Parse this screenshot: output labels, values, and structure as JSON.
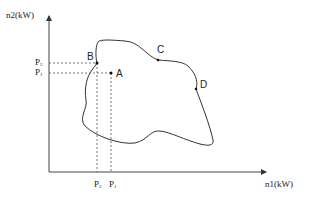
{
  "axes": {
    "y_label": "n2(kW)",
    "x_label": "n1(kW)"
  },
  "points": {
    "A": "A",
    "B": "B",
    "C": "C",
    "D": "D"
  },
  "y_ticks": [
    {
      "base": "P",
      "sub": "2"
    },
    {
      "base": "P",
      "sub": "1"
    }
  ],
  "x_ticks": [
    {
      "base": "P",
      "sub": "2"
    },
    {
      "base": "P",
      "sub": "1"
    }
  ],
  "colors": {
    "line": "#333333",
    "dashed": "#555555"
  }
}
